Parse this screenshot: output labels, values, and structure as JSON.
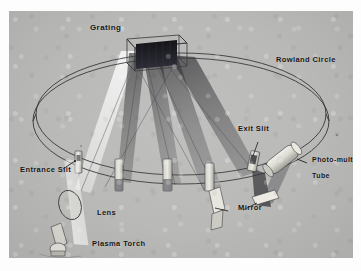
{
  "figure": {
    "kind": "optical-diagram",
    "background_color": "#b9b9b7",
    "ink_color": "#141414",
    "grating_face_color": "#15151a"
  },
  "labels": {
    "grating": "Grating",
    "rowland_circle": "Rowland Circle",
    "exit_slit": "Exit Slit",
    "photomultiplier_line1": "Photo-multiplier",
    "photomultiplier_line2": "Tube",
    "entrance_slit": "Entrance Slit",
    "lens": "Lens",
    "plasma_torch": "Plasma Torch",
    "mirror": "Mirror"
  },
  "components": [
    {
      "name": "grating",
      "label": "Grating"
    },
    {
      "name": "rowland-circle",
      "label": "Rowland Circle"
    },
    {
      "name": "entrance-slit",
      "label": "Entrance Slit"
    },
    {
      "name": "exit-slit",
      "label": "Exit Slit"
    },
    {
      "name": "lens",
      "label": "Lens"
    },
    {
      "name": "plasma-torch",
      "label": "Plasma Torch"
    },
    {
      "name": "mirror",
      "label": "Mirror"
    },
    {
      "name": "photomultiplier-tube",
      "label": "Photo-multiplier Tube"
    }
  ]
}
